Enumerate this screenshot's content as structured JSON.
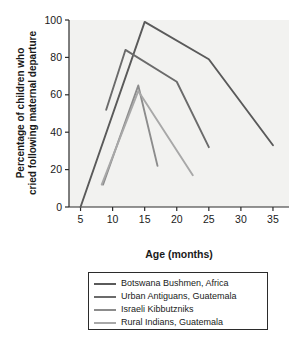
{
  "chart_data": {
    "type": "line",
    "title": "",
    "xlabel": "Age (months)",
    "ylabel": "Percentage of children who cried following maternal departure",
    "ylabel_line1": "Percentage of children who",
    "ylabel_line2": "cried following maternal departure",
    "xlim": [
      3.2,
      37.5
    ],
    "ylim": [
      0,
      100
    ],
    "xticks": [
      5,
      10,
      15,
      20,
      25,
      30,
      35
    ],
    "xtick_labels": [
      "5",
      "10",
      "15",
      "20",
      "25",
      "30",
      "35"
    ],
    "yticks": [
      0,
      20,
      40,
      60,
      80,
      100
    ],
    "ytick_labels": [
      "0",
      "20",
      "40",
      "60",
      "80",
      "100"
    ],
    "grid": false,
    "legend_position": "below-center",
    "plot_background": "#f2f2f0",
    "axis_color": "#2b2b2b",
    "series": [
      {
        "name": "Botswana Bushmen, Africa",
        "color": "#5a5a5a",
        "x": [
          5,
          15,
          25,
          35
        ],
        "y": [
          0,
          99,
          79,
          33
        ]
      },
      {
        "name": "Urban Antiguans, Guatemala",
        "color": "#6b6b6b",
        "x": [
          9,
          12,
          20,
          25
        ],
        "y": [
          52,
          84,
          67,
          32
        ]
      },
      {
        "name": "Israeli Kibbutzniks",
        "color": "#8c8c8c",
        "x": [
          8.5,
          14,
          17
        ],
        "y": [
          12,
          65,
          22
        ]
      },
      {
        "name": "Rural Indians, Guatemala",
        "color": "#a8a8a8",
        "x": [
          8.3,
          14,
          22.5
        ],
        "y": [
          12,
          62,
          17
        ]
      }
    ]
  },
  "legend": {
    "entries": [
      {
        "label": "Botswana Bushmen, Africa",
        "color": "#5a5a5a"
      },
      {
        "label": "Urban Antiguans, Guatemala",
        "color": "#6b6b6b"
      },
      {
        "label": "Israeli Kibbutzniks",
        "color": "#8c8c8c"
      },
      {
        "label": "Rural Indians, Guatemala",
        "color": "#a8a8a8"
      }
    ]
  }
}
